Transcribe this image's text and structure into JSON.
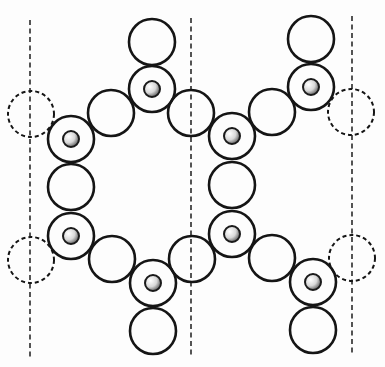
{
  "diagram": {
    "width": 385,
    "height": 367,
    "colors": {
      "stroke": "#151515",
      "background": "#fdfdfd",
      "nucleus_light": "#ffffff",
      "nucleus_dark": "#6a6a6a"
    },
    "atom_radius": 23,
    "nucleus_radius": 8,
    "cell_boundaries": [
      {
        "x": 30,
        "y1": 20,
        "y2": 358
      },
      {
        "x": 191,
        "y1": 18,
        "y2": 358
      },
      {
        "x": 352,
        "y1": 16,
        "y2": 356
      }
    ],
    "atoms": [
      {
        "id": "top-terminal-1",
        "cx": 152,
        "cy": 42,
        "type": "plain"
      },
      {
        "id": "upper-node-1",
        "cx": 152,
        "cy": 89,
        "type": "nucleated"
      },
      {
        "id": "top-terminal-2",
        "cx": 311,
        "cy": 39,
        "type": "plain"
      },
      {
        "id": "upper-node-2",
        "cx": 311,
        "cy": 87,
        "type": "nucleated"
      },
      {
        "id": "left-periodic-upper",
        "cx": 31,
        "cy": 114,
        "type": "dashed"
      },
      {
        "id": "bridge-upper-1",
        "cx": 111,
        "cy": 113,
        "type": "plain"
      },
      {
        "id": "boundary-upper",
        "cx": 191,
        "cy": 113,
        "type": "plain"
      },
      {
        "id": "bridge-upper-2",
        "cx": 272,
        "cy": 112,
        "type": "plain"
      },
      {
        "id": "right-periodic-upper",
        "cx": 351,
        "cy": 112,
        "type": "dashed"
      },
      {
        "id": "ring-a-top",
        "cx": 71,
        "cy": 139,
        "type": "nucleated"
      },
      {
        "id": "ring-b-top",
        "cx": 232,
        "cy": 136,
        "type": "nucleated"
      },
      {
        "id": "ring-a-mid",
        "cx": 71,
        "cy": 187,
        "type": "plain"
      },
      {
        "id": "ring-b-mid",
        "cx": 232,
        "cy": 185,
        "type": "plain"
      },
      {
        "id": "ring-a-bottom",
        "cx": 71,
        "cy": 236,
        "type": "nucleated"
      },
      {
        "id": "ring-b-bottom",
        "cx": 232,
        "cy": 234,
        "type": "nucleated"
      },
      {
        "id": "left-periodic-lower",
        "cx": 31,
        "cy": 260,
        "type": "dashed"
      },
      {
        "id": "bridge-lower-1",
        "cx": 112,
        "cy": 259,
        "type": "plain"
      },
      {
        "id": "boundary-lower",
        "cx": 192,
        "cy": 259,
        "type": "plain"
      },
      {
        "id": "bridge-lower-2",
        "cx": 272,
        "cy": 258,
        "type": "plain"
      },
      {
        "id": "right-periodic-lower",
        "cx": 352,
        "cy": 258,
        "type": "dashed"
      },
      {
        "id": "lower-node-1",
        "cx": 153,
        "cy": 283,
        "type": "nucleated"
      },
      {
        "id": "bottom-terminal-1",
        "cx": 153,
        "cy": 331,
        "type": "plain"
      },
      {
        "id": "lower-node-2",
        "cx": 313,
        "cy": 282,
        "type": "nucleated"
      },
      {
        "id": "bottom-terminal-2",
        "cx": 313,
        "cy": 330,
        "type": "plain"
      }
    ]
  }
}
